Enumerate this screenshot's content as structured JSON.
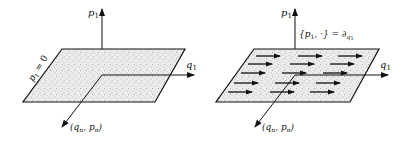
{
  "left_panel": {
    "vertical_axis_label": "p",
    "vertical_axis_sub": "1",
    "horizontal_axis_label": "q",
    "horizontal_axis_sub": "1",
    "diagonal_axis_label": "(q",
    "diagonal_axis_sub1": "n",
    "diagonal_axis_mid": ", p",
    "diagonal_axis_sub2": "n",
    "diagonal_axis_close": ")",
    "plane_label": "p",
    "plane_label_sub": "1",
    "plane_label_eq": " = 0"
  },
  "right_panel": {
    "vertical_axis_label": "p",
    "vertical_axis_sub": "1",
    "horizontal_axis_label": "q",
    "horizontal_axis_sub": "1",
    "diagonal_axis_label": "(q",
    "diagonal_axis_sub1": "n",
    "diagonal_axis_mid": ", p",
    "diagonal_axis_sub2": "n",
    "diagonal_axis_close": ")",
    "bracket_label_open": "{p",
    "bracket_label_sub": "1",
    "bracket_label_rest": ", ·} = ∂",
    "bracket_label_sub2": "q",
    "bracket_label_sub3": "1",
    "flow_arrows_rows": 5,
    "flow_arrows_per_row": 3
  },
  "colors": {
    "line": "#111111",
    "plane_fill": "#e6e6e6"
  }
}
